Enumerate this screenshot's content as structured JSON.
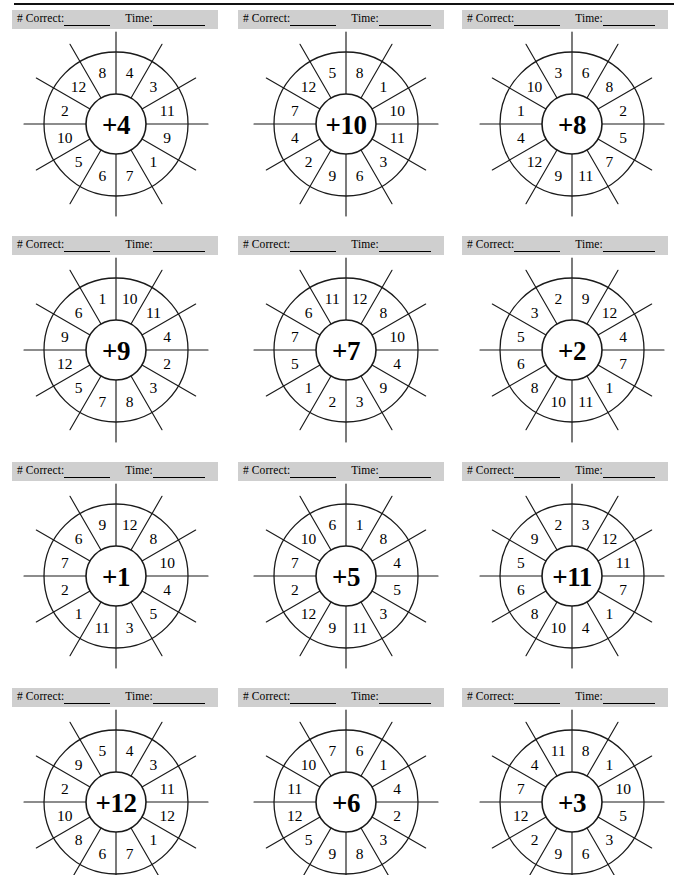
{
  "page": {
    "top_rule": true,
    "band_label_correct": "# Correct:",
    "band_label_time": "Time:",
    "grid_rows": 4,
    "grid_cols": 3,
    "colors": {
      "band_background": "#cfcfcf",
      "ink": "#1a1a1a",
      "paper": "#ffffff"
    }
  },
  "wheels": [
    {
      "id": "wheel-plus-4",
      "operator": "+4",
      "operand": 4,
      "sign": "+",
      "numbers": [
        4,
        3,
        11,
        9,
        1,
        7,
        6,
        5,
        10,
        2,
        12,
        8
      ]
    },
    {
      "id": "wheel-plus-10",
      "operator": "+10",
      "operand": 10,
      "sign": "+",
      "numbers": [
        8,
        1,
        10,
        11,
        3,
        6,
        9,
        2,
        4,
        7,
        12,
        5
      ]
    },
    {
      "id": "wheel-plus-8",
      "operator": "+8",
      "operand": 8,
      "sign": "+",
      "numbers": [
        6,
        8,
        2,
        5,
        7,
        11,
        9,
        12,
        4,
        1,
        10,
        3
      ]
    },
    {
      "id": "wheel-plus-9",
      "operator": "+9",
      "operand": 9,
      "sign": "+",
      "numbers": [
        10,
        11,
        4,
        2,
        3,
        8,
        7,
        5,
        12,
        9,
        6,
        1
      ]
    },
    {
      "id": "wheel-plus-7",
      "operator": "+7",
      "operand": 7,
      "sign": "+",
      "numbers": [
        12,
        8,
        10,
        4,
        9,
        3,
        2,
        1,
        5,
        7,
        6,
        11
      ]
    },
    {
      "id": "wheel-plus-2",
      "operator": "+2",
      "operand": 2,
      "sign": "+",
      "numbers": [
        9,
        12,
        4,
        7,
        1,
        11,
        10,
        8,
        6,
        5,
        3,
        2
      ]
    },
    {
      "id": "wheel-plus-1",
      "operator": "+1",
      "operand": 1,
      "sign": "+",
      "numbers": [
        12,
        8,
        10,
        4,
        5,
        3,
        11,
        1,
        2,
        7,
        6,
        9
      ]
    },
    {
      "id": "wheel-plus-5",
      "operator": "+5",
      "operand": 5,
      "sign": "+",
      "numbers": [
        1,
        8,
        4,
        5,
        3,
        11,
        9,
        12,
        2,
        7,
        10,
        6
      ]
    },
    {
      "id": "wheel-plus-11",
      "operator": "+11",
      "operand": 11,
      "sign": "+",
      "numbers": [
        3,
        12,
        11,
        7,
        1,
        4,
        10,
        8,
        6,
        5,
        9,
        2
      ]
    },
    {
      "id": "wheel-plus-12",
      "operator": "+12",
      "operand": 12,
      "sign": "+",
      "numbers": [
        4,
        3,
        11,
        12,
        1,
        7,
        6,
        8,
        10,
        2,
        9,
        5
      ]
    },
    {
      "id": "wheel-plus-6",
      "operator": "+6",
      "operand": 6,
      "sign": "+",
      "numbers": [
        6,
        1,
        4,
        2,
        3,
        8,
        9,
        5,
        12,
        11,
        10,
        7
      ]
    },
    {
      "id": "wheel-plus-3",
      "operator": "+3",
      "operand": 3,
      "sign": "+",
      "numbers": [
        8,
        1,
        10,
        5,
        3,
        6,
        9,
        2,
        12,
        7,
        4,
        11
      ]
    }
  ]
}
